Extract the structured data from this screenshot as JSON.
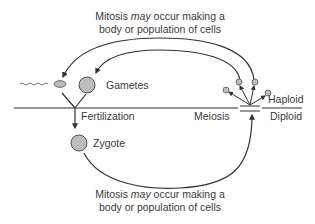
{
  "diagram": {
    "type": "life-cycle",
    "top_caption": {
      "line1_prefix": "Mitosis ",
      "line1_emphasis": "may",
      "line1_suffix": " occur making a",
      "line2": "body or population of cells"
    },
    "bottom_caption": {
      "line1_prefix": "Mitosis ",
      "line1_emphasis": "may",
      "line1_suffix": " occur making a",
      "line2": "body or population of cells"
    },
    "labels": {
      "gametes": "Gametes",
      "fertilization": "Fertilization",
      "zygote": "Zygote",
      "meiosis": "Meiosis",
      "haploid": "Haploid",
      "diploid": "Diploid"
    },
    "colors": {
      "line": "#333333",
      "cell_fill": "#bdbdbd",
      "cell_stroke": "#555555",
      "text": "#3a3a3a"
    },
    "nodes": [
      {
        "id": "sperm",
        "kind": "sperm-cell"
      },
      {
        "id": "egg",
        "kind": "gamete-cell"
      },
      {
        "id": "zygote",
        "kind": "zygote-cell"
      },
      {
        "id": "meiosis-products",
        "kind": "haploid-cells",
        "count": 4
      }
    ],
    "edges": [
      {
        "from": "meiosis-products",
        "to": "sperm",
        "label": "top_caption"
      },
      {
        "from": "meiosis-products",
        "to": "egg",
        "label": "top_caption"
      },
      {
        "from": "sperm",
        "to": "zygote",
        "label": "fertilization"
      },
      {
        "from": "egg",
        "to": "zygote",
        "label": "fertilization"
      },
      {
        "from": "zygote",
        "to": "meiosis-products",
        "label": "bottom_caption"
      }
    ],
    "divider": {
      "above": "Haploid",
      "below": "Diploid"
    }
  }
}
